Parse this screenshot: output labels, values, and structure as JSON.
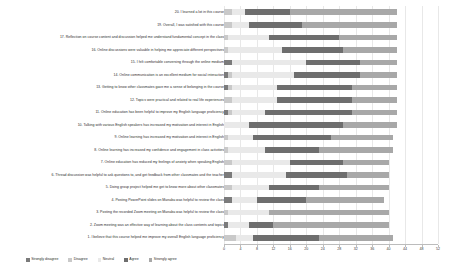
{
  "chart_data": {
    "type": "bar",
    "subtype": "stacked-horizontal-likert",
    "title": "",
    "xlabel": "",
    "ylabel": "",
    "grid": true,
    "legend_position": "bottom-left",
    "xlim": [
      0,
      52
    ],
    "xticks": [
      0,
      4,
      8,
      12,
      16,
      20,
      24,
      28,
      32,
      36,
      40,
      44,
      48,
      52
    ],
    "xtick_labels": [
      "0",
      "4",
      "8",
      "12",
      "16",
      "20",
      "24",
      "28",
      "32",
      "36",
      "40",
      "44",
      "48",
      "52"
    ],
    "series": [
      {
        "name": "Strongly disagree",
        "color": "#7b7b7b"
      },
      {
        "name": "Disagree",
        "color": "#c9c9c9"
      },
      {
        "name": "Neutral",
        "color": "#e9e9e9"
      },
      {
        "name": "Agree",
        "color": "#6e6e6e"
      },
      {
        "name": "Strongly agree",
        "color": "#a8a8a8"
      }
    ],
    "categories": [
      "20. I learned a lot in this course",
      "19. Overall, I was satisfied with this course",
      "17. Reflection on course content and discussion helped me understand fundamental concept in the class",
      "16. Online discussions were valuable in helping me appreciate different perspectives",
      "15. I felt comfortable conversing through the online medium",
      "14. Online communication is an excellent medium for social interaction",
      "13. Getting to know other classmates gave me a sense of belonging in the course",
      "12. Topics were practical and related to real life experiences",
      "11. Online education has been helpful to improve my English language proficiency",
      "10. Talking with various English speakers has increased my motivation and interest in English",
      "9. Online learning has increased my motivation and interest in English",
      "8. Online learning has increased my confidence and engagement in class activities",
      "7. Online education has reduced my feelings of anxiety when speaking English",
      "6. Thread discussion was helpful to ask questions to, and get feedback from other classmates and the teacher",
      "5. Doing group project helped me get to know more about other classmates",
      "4. Posting PowerPoint slides on Manaba was helpful to review the class",
      "3. Posting the recorded Zoom meeting on Manaba was helpful to review the class",
      "2. Zoom meeting was an effective way of learning about the class contents and topics",
      "1. I believe that this course helped me improve my overall English language proficiency"
    ],
    "rows": [
      {
        "category": "20. I learned a lot in this course",
        "values": [
          0,
          2,
          3,
          11,
          26
        ]
      },
      {
        "category": "19. Overall, I was satisfied with this course",
        "values": [
          0,
          2,
          4,
          13,
          23
        ]
      },
      {
        "category": "17. Reflection on course content and discussion helped me understand fundamental concept in the class",
        "values": [
          0,
          1,
          10,
          17,
          14
        ]
      },
      {
        "category": "16. Online discussions were valuable in helping me appreciate different perspectives",
        "values": [
          0,
          1,
          13,
          15,
          13
        ]
      },
      {
        "category": "15. I felt comfortable conversing through the online medium",
        "values": [
          2,
          0,
          18,
          13,
          9
        ]
      },
      {
        "category": "14. Online communication is an excellent medium for social interaction",
        "values": [
          1,
          1,
          15,
          16,
          9
        ]
      },
      {
        "category": "13. Getting to know other classmates gave me a sense of belonging in the course",
        "values": [
          1,
          1,
          11,
          18,
          11
        ]
      },
      {
        "category": "12. Topics were practical and related to real life experiences",
        "values": [
          0,
          2,
          11,
          18,
          11
        ]
      },
      {
        "category": "11. Online education has been helpful to improve my English language proficiency",
        "values": [
          1,
          1,
          8,
          21,
          11
        ]
      },
      {
        "category": "10. Talking with various English speakers has increased my motivation and interest in English",
        "values": [
          0,
          0,
          6,
          23,
          13
        ]
      },
      {
        "category": "9. Online learning has increased my motivation and interest in English",
        "values": [
          0,
          1,
          6,
          19,
          15
        ]
      },
      {
        "category": "8. Online learning has increased my confidence and engagement in class activities",
        "values": [
          0,
          1,
          9,
          13,
          18
        ]
      },
      {
        "category": "7. Online education has reduced my feelings of anxiety when speaking English",
        "values": [
          0,
          2,
          14,
          13,
          11
        ]
      },
      {
        "category": "6. Thread discussion was helpful to ask questions to, and get feedback from other classmates and the teacher",
        "values": [
          2,
          0,
          13,
          15,
          10
        ]
      },
      {
        "category": "5. Doing group project helped me get to know more about other classmates",
        "values": [
          0,
          2,
          9,
          12,
          17
        ]
      },
      {
        "category": "4. Posting PowerPoint slides on Manaba was helpful to review the class",
        "values": [
          2,
          0,
          6,
          12,
          19
        ]
      },
      {
        "category": "3. Posting the recorded Zoom meeting on Manaba was helpful to review the class",
        "values": [
          0,
          1,
          10,
          0,
          29
        ]
      },
      {
        "category": "2. Zoom meeting was an effective way of learning about the class contents and topics",
        "values": [
          1,
          0,
          5,
          6,
          28
        ]
      },
      {
        "category": "1. I believe that this course helped me improve my overall English language proficiency",
        "values": [
          0,
          3,
          4,
          16,
          18
        ]
      }
    ]
  },
  "legend": {
    "items": [
      {
        "label": "Strongly disagree",
        "color": "#7b7b7b"
      },
      {
        "label": "Disagree",
        "color": "#c9c9c9"
      },
      {
        "label": "Neutral",
        "color": "#e9e9e9"
      },
      {
        "label": "Agree",
        "color": "#6e6e6e"
      },
      {
        "label": "Strongly agree",
        "color": "#a8a8a8"
      }
    ]
  }
}
